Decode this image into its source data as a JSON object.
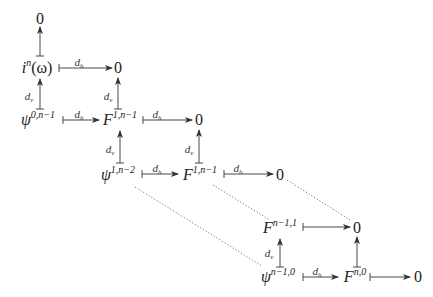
{
  "diagram": {
    "type": "commutative-diagram",
    "nodes": {
      "zero_top": {
        "base": "0",
        "sup": ""
      },
      "i_omega": {
        "base": "i",
        "sup": "n",
        "tail": "(ω)"
      },
      "zero_r1": {
        "base": "0",
        "sup": ""
      },
      "psi_0": {
        "base": "ψ",
        "sup": "0,n−1"
      },
      "F_1a": {
        "base": "F",
        "sup": "1,n−1"
      },
      "zero_r2": {
        "base": "0",
        "sup": ""
      },
      "psi_1": {
        "base": "ψ",
        "sup": "1,n−2"
      },
      "F_1b": {
        "base": "F",
        "sup": "1,n−1"
      },
      "zero_r3": {
        "base": "0",
        "sup": ""
      },
      "F_n1": {
        "base": "F",
        "sup": "n−1,1"
      },
      "zero_r4": {
        "base": "0",
        "sup": ""
      },
      "psi_n1": {
        "base": "ψ",
        "sup": "n−1,0"
      },
      "F_n0": {
        "base": "F",
        "sup": "n,0"
      },
      "zero_r5": {
        "base": "0",
        "sup": ""
      }
    },
    "labels": {
      "dh": {
        "base": "d",
        "sub": "h"
      },
      "dv": {
        "base": "d",
        "sub": "v"
      }
    },
    "edges": [
      {
        "from": "i_omega",
        "to": "zero_top",
        "label": ""
      },
      {
        "from": "i_omega",
        "to": "zero_r1",
        "label": "d_h"
      },
      {
        "from": "psi_0",
        "to": "i_omega",
        "label": "d_v"
      },
      {
        "from": "psi_0",
        "to": "F_1a",
        "label": "d_h"
      },
      {
        "from": "F_1a",
        "to": "zero_r1",
        "label": "d_v"
      },
      {
        "from": "F_1a",
        "to": "zero_r2",
        "label": "d_h"
      },
      {
        "from": "psi_1",
        "to": "F_1a",
        "label": "d_v"
      },
      {
        "from": "psi_1",
        "to": "F_1b",
        "label": "d_h"
      },
      {
        "from": "F_1b",
        "to": "zero_r2",
        "label": "d_v"
      },
      {
        "from": "F_1b",
        "to": "zero_r3",
        "label": "d_h"
      },
      {
        "from": "F_n1",
        "to": "zero_r4",
        "label": ""
      },
      {
        "from": "psi_n1",
        "to": "F_n1",
        "label": "d_v"
      },
      {
        "from": "psi_n1",
        "to": "F_n0",
        "label": "d_h"
      },
      {
        "from": "F_n0",
        "to": "zero_r4",
        "label": ""
      },
      {
        "from": "F_n0",
        "to": "zero_r5",
        "label": ""
      }
    ],
    "dotted_continuations": [
      {
        "from": "psi_1",
        "to": "psi_n1"
      },
      {
        "from": "F_1b",
        "to": "F_n1"
      },
      {
        "from": "zero_r3",
        "to": "zero_r4"
      }
    ]
  }
}
